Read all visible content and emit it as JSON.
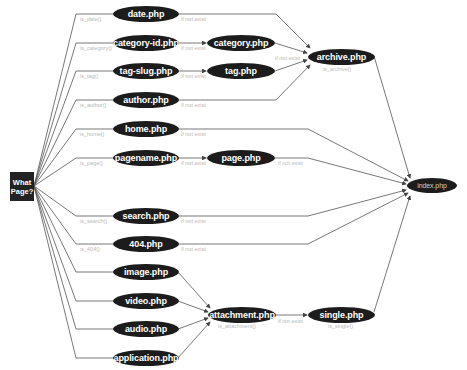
{
  "diagram": {
    "start": {
      "line1": "What",
      "line2": "Page?"
    },
    "conditions": {
      "is_date": "is_date()",
      "is_category": "is_category()",
      "is_tag": "is_tag()",
      "is_author": "is_author()",
      "is_home": "is_home()",
      "is_page": "is_page()",
      "is_search": "is_search()",
      "is_404": "is_404()",
      "is_archive": "is_archive()",
      "is_attachment": "is_attachment()",
      "is_single": "is_single()"
    },
    "if_not_exist": "if not exist",
    "nodes": {
      "date": "date.php",
      "category_id": "category-id.php",
      "category": "category.php",
      "tag_slug": "tag-slug.php",
      "tag": "tag.php",
      "author": "author.php",
      "archive": "archive.php",
      "home": "home.php",
      "pagename": "pagename.php",
      "page": "page.php",
      "index": "index.php",
      "search": "search.php",
      "notfound": "404.php",
      "image": "image.php",
      "video": "video.php",
      "audio": "audio.php",
      "application": "application.php",
      "attachment": "attachment.php",
      "single": "single.php"
    },
    "colors": {
      "node_fill": "#1c1c1c",
      "line": "#555555",
      "label": "#b8b8b8"
    }
  }
}
